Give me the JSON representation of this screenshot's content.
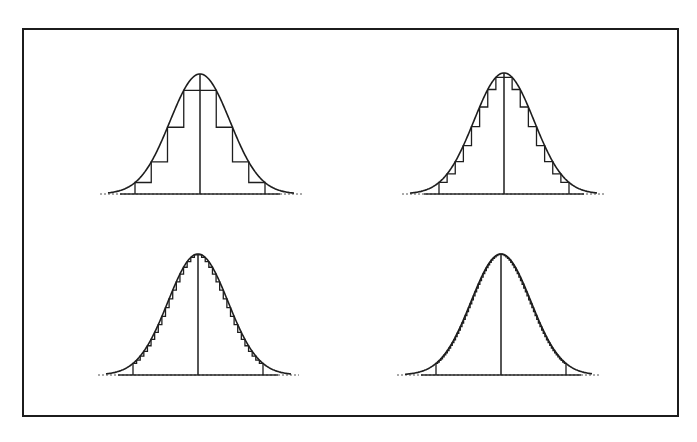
{
  "figure": {
    "colors": {
      "ink": "#1e1e1e",
      "background": "#ffffff"
    },
    "frame": {
      "x": 22,
      "y": 28,
      "width": 657,
      "height": 389
    },
    "panels": [
      {
        "id": "top-left",
        "center_x": 200,
        "baseline_y": 194,
        "peak_y": 74,
        "axis_x0": 100,
        "axis_x1": 302,
        "sigma_px": 30,
        "steps_per_side": 4,
        "step_width_px": 10
      },
      {
        "id": "top-right",
        "center_x": 504,
        "baseline_y": 194,
        "peak_y": 73,
        "axis_x0": 402,
        "axis_x1": 605,
        "sigma_px": 30,
        "steps_per_side": 8,
        "step_width_px": 6.2
      },
      {
        "id": "bottom-left",
        "center_x": 198,
        "baseline_y": 375,
        "peak_y": 254,
        "axis_x0": 98,
        "axis_x1": 299,
        "sigma_px": 30,
        "steps_per_side": 18,
        "step_width_px": 3.1
      },
      {
        "id": "bottom-right",
        "center_x": 501,
        "baseline_y": 375,
        "peak_y": 254,
        "axis_x0": 397,
        "axis_x1": 600,
        "sigma_px": 30,
        "steps_per_side": 40,
        "step_width_px": 1.6
      }
    ]
  }
}
